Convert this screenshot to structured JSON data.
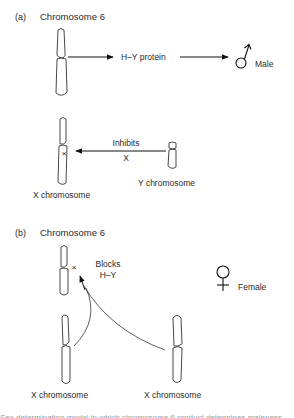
{
  "panel_a": {
    "label": "(a)",
    "title": "Chromosome 6",
    "arrow1_label": "H–Y protein",
    "male_label": "Male",
    "inhibits_label": "Inhibits",
    "inhibits_gene": "X",
    "x_chromosome_label": "X chromosome",
    "y_chromosome_label": "Y chromosome",
    "icons": {
      "male": "male-symbol-icon"
    }
  },
  "panel_b": {
    "label": "(b)",
    "title": "Chromosome 6",
    "blocks_label_line1": "Blocks",
    "blocks_label_line2": "H–Y",
    "female_label": "Female",
    "x_chromosome_left_label": "X chromosome",
    "x_chromosome_right_label": "X chromosome",
    "icons": {
      "female": "female-symbol-icon"
    }
  },
  "caption": "Sex determination model in which chromosome 6 product determines maleness"
}
